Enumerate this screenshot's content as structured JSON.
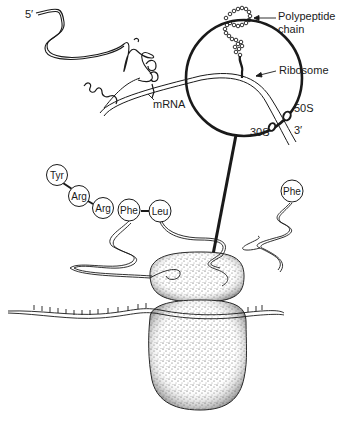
{
  "diagram": {
    "type": "biology-illustration",
    "labels": {
      "five_prime": "5′",
      "three_prime": "3′",
      "mrna": "mRNA",
      "polypeptide_line1": "Polypeptide",
      "polypeptide_line2": "chain",
      "ribosome": "Ribosome",
      "large_subunit": "50S",
      "small_subunit": "30S"
    },
    "amino_acids": [
      {
        "label": "Tyr",
        "cx": 57,
        "cy": 175
      },
      {
        "label": "Arg",
        "cx": 79,
        "cy": 196
      },
      {
        "label": "Arg",
        "cx": 103,
        "cy": 208
      },
      {
        "label": "Phe",
        "cx": 129,
        "cy": 210
      },
      {
        "label": "Leu",
        "cx": 160,
        "cy": 211
      },
      {
        "label": "Phe",
        "cx": 292,
        "cy": 191
      }
    ],
    "colors": {
      "ink": "#1a1a1a",
      "background": "#ffffff",
      "stipple": "#555555"
    }
  }
}
